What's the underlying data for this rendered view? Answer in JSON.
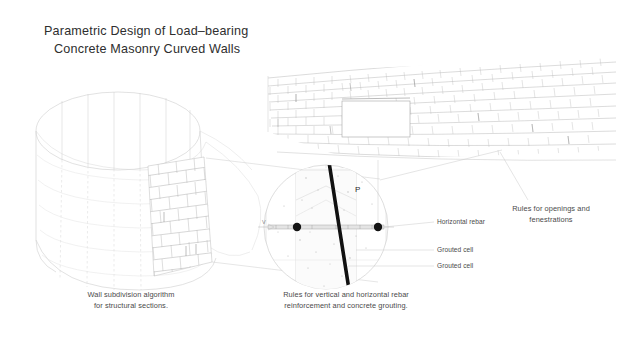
{
  "document": {
    "title_line_1": "Parametric Design of Load–bearing",
    "title_line_2": "Concrete Masonry Curved Walls"
  },
  "captions": {
    "wall_subdivision": {
      "line_1": "Wall subdivision algorithm",
      "line_2": "for structural sections."
    },
    "rebar_rules": {
      "line_1": "Rules for vertical and horizontal rebar",
      "line_2": "reinforcement and concrete grouting."
    },
    "openings_rules": {
      "line_1": "Rules for openings and",
      "line_2": "fenestrations"
    }
  },
  "callouts": {
    "horizontal_rebar": "Horizontal rebar",
    "grouted_cell_1": "Grouted cell",
    "grouted_cell_2": "Grouted cell",
    "point_p": "P",
    "vertical_mark": "V"
  },
  "figures": {
    "curved_wall_cylinder": "curved-masonry-wall-3d",
    "perspective_brick_wall": "perspective-brick-wall-with-opening",
    "detail_circle": "rebar-grouting-detail-section"
  },
  "colors": {
    "background": "#ffffff",
    "title_text": "#2e2e2e",
    "caption_text": "#4a4a4a",
    "line_light": "#d8d8d8",
    "line_medium": "#b4b4b4",
    "line_dark": "#6f6f6f",
    "rebar_black": "#151515",
    "leader_line": "#c9c9c9"
  }
}
